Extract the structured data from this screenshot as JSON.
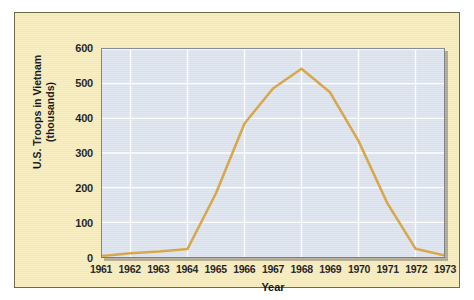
{
  "panel": {
    "background_color": "#f7ecba",
    "border_color": "#6f6a4a"
  },
  "chart_data": {
    "type": "line",
    "title": "",
    "subtitle": "",
    "xlabel": "Year",
    "ylabel": "U.S. Troops in Vietnam (thousands)",
    "ylabel_line1": "U.S. Troops in Vietnam",
    "ylabel_line2": "(thousands)",
    "categories": [
      "1961",
      "1962",
      "1963",
      "1964",
      "1965",
      "1966",
      "1967",
      "1968",
      "1969",
      "1970",
      "1971",
      "1972",
      "1973"
    ],
    "x": [
      1961,
      1962,
      1963,
      1964,
      1965,
      1966,
      1967,
      1968,
      1969,
      1970,
      1971,
      1972,
      1973
    ],
    "values": [
      3,
      11,
      16,
      23,
      184,
      385,
      486,
      543,
      475,
      335,
      157,
      24,
      5
    ],
    "series": [
      {
        "name": "U.S. Troops in Vietnam",
        "color": "#d9a441",
        "values": [
          3,
          11,
          16,
          23,
          184,
          385,
          486,
          543,
          475,
          335,
          157,
          24,
          5
        ]
      }
    ],
    "ylim": [
      0,
      600
    ],
    "xlim": [
      1961,
      1973
    ],
    "yticks": [
      0,
      100,
      200,
      300,
      400,
      500,
      600
    ],
    "ytick_labels": [
      "0",
      "100",
      "200",
      "300",
      "400",
      "500",
      "600"
    ],
    "xtick_labels": [
      "1961",
      "1962",
      "1963",
      "1964",
      "1965",
      "1966",
      "1967",
      "1968",
      "1969",
      "1970",
      "1971",
      "1972",
      "1973"
    ],
    "grid": true,
    "grid_color": "#ffffff",
    "plot_background": "#dde4ef",
    "legend": null,
    "legend_position": "none",
    "annotations": []
  }
}
